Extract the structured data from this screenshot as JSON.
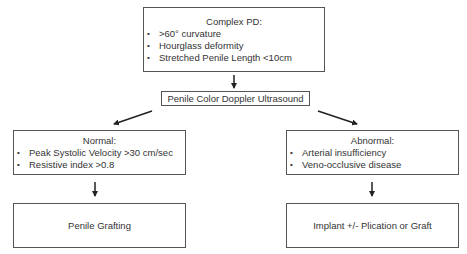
{
  "diagram": {
    "complex_pd": {
      "title": "Complex PD:",
      "items": [
        ">60° curvature",
        "Hourglass deformity",
        "Stretched Penile Length <10cm"
      ]
    },
    "doppler": {
      "label": "Penile Color Doppler Ultrasound"
    },
    "normal": {
      "title": "Normal:",
      "items": [
        "Peak Systolic Velocity >30 cm/sec",
        "Resistive index >0.8"
      ]
    },
    "abnormal": {
      "title": "Abnormal:",
      "items": [
        "Arterial insufficiency",
        "Veno-occlusive disease"
      ]
    },
    "normal_outcome": {
      "label": "Penile Grafting"
    },
    "abnormal_outcome": {
      "label": "Implant +/- Plication or Graft"
    },
    "edges": [
      {
        "from": "complex_pd",
        "to": "doppler"
      },
      {
        "from": "doppler",
        "to": "normal"
      },
      {
        "from": "doppler",
        "to": "abnormal"
      },
      {
        "from": "normal",
        "to": "normal_outcome"
      },
      {
        "from": "abnormal",
        "to": "abnormal_outcome"
      }
    ],
    "colors": {
      "border": "#555555",
      "text": "#333333",
      "arrow": "#222222",
      "background": "#ffffff"
    }
  }
}
